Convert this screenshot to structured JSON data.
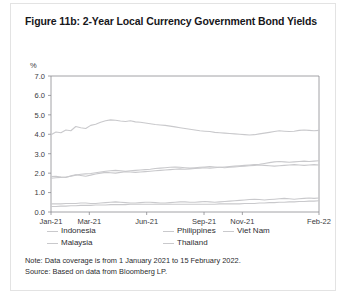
{
  "figure": {
    "title": "Figure 11b: 2-Year Local Currency Government Bond Yields",
    "note": "Note: Data coverage is from 1 January 2021 to 15 February 2022.",
    "source": "Source: Based on data from Bloomberg LP."
  },
  "colors": {
    "line": "#c9c9cc",
    "axis": "#8a8a8f",
    "text": "#2e2e31",
    "title": "#17171a",
    "card_border": "#e3e3e3"
  },
  "chart_data": {
    "type": "line",
    "title": "Figure 11b: 2-Year Local Currency Government Bond Yields",
    "xlabel": "",
    "ylabel": "%",
    "ylim": [
      0.0,
      7.0
    ],
    "yticks": [
      "0.0",
      "1.0",
      "2.0",
      "3.0",
      "4.0",
      "5.0",
      "6.0",
      "7.0"
    ],
    "ytick_values": [
      0.0,
      1.0,
      2.0,
      3.0,
      4.0,
      5.0,
      6.0,
      7.0
    ],
    "xticks": [
      "Jan-21",
      "Mar-21",
      "Jun-21",
      "Sep-21",
      "Nov-21",
      "Feb-22"
    ],
    "xtick_positions": [
      0,
      0.143,
      0.357,
      0.571,
      0.714,
      1.0
    ],
    "grid": false,
    "legend_position": "below",
    "series": [
      {
        "name": "Indonesia",
        "values": [
          3.98,
          4.12,
          4.08,
          4.22,
          4.18,
          4.4,
          4.34,
          4.3,
          4.46,
          4.52,
          4.62,
          4.7,
          4.74,
          4.72,
          4.68,
          4.66,
          4.7,
          4.64,
          4.62,
          4.58,
          4.54,
          4.5,
          4.48,
          4.46,
          4.42,
          4.38,
          4.34,
          4.3,
          4.26,
          4.22,
          4.18,
          4.16,
          4.14,
          4.1,
          4.08,
          4.06,
          4.04,
          4.02,
          4.0,
          3.98,
          3.96,
          3.98,
          4.02,
          4.06,
          4.1,
          4.14,
          4.18,
          4.16,
          4.14,
          4.16,
          4.2,
          4.22,
          4.2,
          4.18,
          4.2
        ]
      },
      {
        "name": "Malaysia",
        "values": [
          1.82,
          1.84,
          1.8,
          1.78,
          1.86,
          1.92,
          1.88,
          1.84,
          1.9,
          1.96,
          2.0,
          2.04,
          2.02,
          2.0,
          2.04,
          2.08,
          2.06,
          2.04,
          2.06,
          2.08,
          2.1,
          2.12,
          2.14,
          2.16,
          2.18,
          2.2,
          2.22,
          2.2,
          2.22,
          2.24,
          2.26,
          2.28,
          2.26,
          2.28,
          2.3,
          2.32,
          2.34,
          2.36,
          2.38,
          2.4,
          2.42,
          2.44,
          2.46,
          2.5,
          2.54,
          2.58,
          2.6,
          2.58,
          2.56,
          2.58,
          2.6,
          2.62,
          2.6,
          2.62,
          2.64
        ]
      },
      {
        "name": "Philippines",
        "values": [
          1.74,
          1.76,
          1.78,
          1.8,
          1.84,
          1.9,
          1.94,
          1.96,
          1.98,
          2.02,
          2.06,
          2.1,
          2.12,
          2.14,
          2.12,
          2.1,
          2.12,
          2.14,
          2.16,
          2.18,
          2.2,
          2.24,
          2.26,
          2.28,
          2.3,
          2.32,
          2.3,
          2.28,
          2.26,
          2.28,
          2.3,
          2.32,
          2.34,
          2.32,
          2.3,
          2.28,
          2.3,
          2.32,
          2.34,
          2.36,
          2.38,
          2.4,
          2.42,
          2.4,
          2.38,
          2.36,
          2.38,
          2.4,
          2.42,
          2.44,
          2.42,
          2.4,
          2.42,
          2.44,
          2.42
        ]
      },
      {
        "name": "Thailand",
        "values": [
          0.42,
          0.42,
          0.42,
          0.44,
          0.44,
          0.44,
          0.46,
          0.46,
          0.44,
          0.44,
          0.46,
          0.48,
          0.5,
          0.52,
          0.5,
          0.48,
          0.46,
          0.46,
          0.48,
          0.5,
          0.5,
          0.48,
          0.46,
          0.46,
          0.48,
          0.5,
          0.52,
          0.52,
          0.5,
          0.5,
          0.52,
          0.54,
          0.52,
          0.5,
          0.52,
          0.54,
          0.56,
          0.58,
          0.6,
          0.62,
          0.64,
          0.66,
          0.64,
          0.62,
          0.64,
          0.66,
          0.68,
          0.7,
          0.68,
          0.66,
          0.68,
          0.7,
          0.72,
          0.7,
          0.72
        ]
      },
      {
        "name": "Viet Nam",
        "values": [
          0.28,
          0.28,
          0.3,
          0.3,
          0.32,
          0.32,
          0.34,
          0.34,
          0.34,
          0.36,
          0.36,
          0.36,
          0.38,
          0.38,
          0.38,
          0.38,
          0.4,
          0.4,
          0.4,
          0.4,
          0.4,
          0.4,
          0.4,
          0.4,
          0.4,
          0.4,
          0.4,
          0.4,
          0.4,
          0.4,
          0.4,
          0.4,
          0.4,
          0.4,
          0.42,
          0.42,
          0.42,
          0.42,
          0.42,
          0.44,
          0.44,
          0.44,
          0.46,
          0.46,
          0.48,
          0.48,
          0.5,
          0.5,
          0.52,
          0.52,
          0.54,
          0.54,
          0.56,
          0.56,
          0.58
        ]
      }
    ],
    "legend": [
      "Indonesia",
      "Philippines",
      "Viet Nam",
      "Malaysia",
      "Thailand"
    ]
  }
}
